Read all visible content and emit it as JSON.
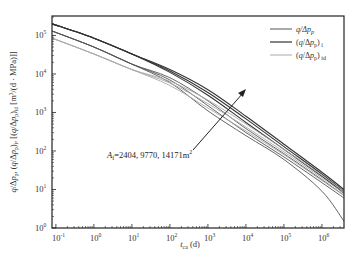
{
  "chart_data": {
    "type": "line",
    "title": "",
    "xlabel": "t_ca (d)",
    "ylabel": "q/Δp_p, (q/Δp_p)_i, (q/Δp_p)_id [m³/(d·MPa)]",
    "xscale": "log",
    "yscale": "log",
    "xlim": [
      0.079,
      3800000
    ],
    "ylim": [
      1,
      320000
    ],
    "x_ticks": [
      "10^-1",
      "10^0",
      "10^1",
      "10^2",
      "10^3",
      "10^4",
      "10^5",
      "10^6"
    ],
    "y_ticks": [
      "10^0",
      "10^1",
      "10^2",
      "10^3",
      "10^4",
      "10^5"
    ],
    "grid": false,
    "legend_position": "upper right",
    "legend": [
      {
        "label": "q/Δp_p",
        "color": "#555555"
      },
      {
        "label": "(q/Δp_p)_i",
        "color": "#333333"
      },
      {
        "label": "(q/Δp_p)_id",
        "color": "#aaaaaa"
      }
    ],
    "annotation": {
      "text": "A_f=2404, 9770, 14171m²",
      "arrow": "increasing A_f direction (lower-left to upper-right)"
    },
    "series": [
      {
        "name": "q/Δp_p (A_f=2404)",
        "group": "q/Δp_p",
        "x": [
          0.08,
          1,
          10,
          100,
          1000,
          10000,
          100000,
          1000000,
          3800000
        ],
        "y": [
          130000,
          50000,
          18000,
          6000,
          1100,
          250,
          60,
          9,
          1.5
        ]
      },
      {
        "name": "q/Δp_p (A_f=9770)",
        "group": "q/Δp_p",
        "x": [
          0.08,
          1,
          10,
          100,
          1000,
          10000,
          100000,
          1000000,
          3800000
        ],
        "y": [
          130000,
          50000,
          18000,
          7000,
          1500,
          300,
          70,
          15,
          6
        ]
      },
      {
        "name": "q/Δp_p (A_f=14171)",
        "group": "q/Δp_p",
        "x": [
          0.08,
          1,
          10,
          100,
          1000,
          10000,
          100000,
          1000000,
          3800000
        ],
        "y": [
          130000,
          50000,
          18000,
          8000,
          2000,
          380,
          85,
          18,
          7
        ]
      },
      {
        "name": "(q/Δp_p)_i (A_f=2404)",
        "group": "(q/Δp_p)_i",
        "x": [
          0.08,
          1,
          10,
          100,
          1000,
          10000,
          100000,
          1000000,
          3800000
        ],
        "y": [
          200000,
          85000,
          33000,
          11000,
          2800,
          550,
          110,
          22,
          8
        ]
      },
      {
        "name": "(q/Δp_p)_i (A_f=9770)",
        "group": "(q/Δp_p)_i",
        "x": [
          0.08,
          1,
          10,
          100,
          1000,
          10000,
          100000,
          1000000,
          3800000
        ],
        "y": [
          200000,
          85000,
          33000,
          12000,
          3300,
          680,
          130,
          25,
          9
        ]
      },
      {
        "name": "(q/Δp_p)_i (A_f=14171)",
        "group": "(q/Δp_p)_i",
        "x": [
          0.08,
          1,
          10,
          100,
          1000,
          10000,
          100000,
          1000000,
          3800000
        ],
        "y": [
          200000,
          85000,
          33000,
          13000,
          3900,
          800,
          150,
          28,
          10
        ]
      },
      {
        "name": "(q/Δp_p)_id (A_f=2404)",
        "group": "(q/Δp_p)_id",
        "x": [
          0.08,
          1,
          10,
          100,
          1000,
          10000,
          100000,
          1000000,
          3800000
        ],
        "y": [
          85000,
          33000,
          13000,
          5000,
          1300,
          330,
          80,
          17,
          7
        ]
      },
      {
        "name": "(q/Δp_p)_id (A_f=9770)",
        "group": "(q/Δp_p)_id",
        "x": [
          0.08,
          1,
          10,
          100,
          1000,
          10000,
          100000,
          1000000,
          3800000
        ],
        "y": [
          85000,
          33000,
          13000,
          5800,
          1700,
          420,
          95,
          20,
          8
        ]
      },
      {
        "name": "(q/Δp_p)_id (A_f=14171)",
        "group": "(q/Δp_p)_id",
        "x": [
          0.08,
          1,
          10,
          100,
          1000,
          10000,
          100000,
          1000000,
          3800000
        ],
        "y": [
          85000,
          33000,
          13000,
          6500,
          2100,
          500,
          110,
          23,
          9
        ]
      }
    ]
  },
  "labels": {
    "x_axis": "t",
    "x_axis_sub": "ca",
    "x_axis_unit": "(d)",
    "y_axis": "q/Δp_p, (q/Δp_p)_i, (q/Δp_p)_id [m³/(d·MPa)]",
    "annotation": "A_f=2404, 9770, 14171m²"
  }
}
